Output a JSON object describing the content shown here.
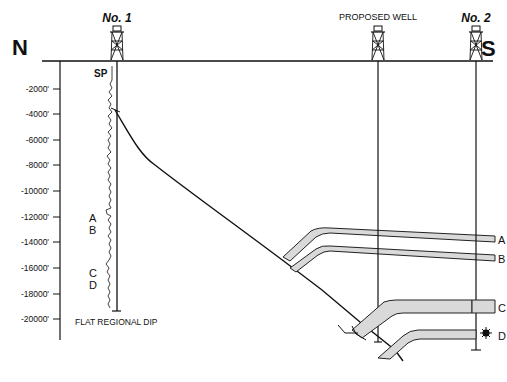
{
  "diagram": {
    "compass": {
      "left": "N",
      "right": "S"
    },
    "wells": [
      {
        "name": "No. 1",
        "x": 117
      },
      {
        "name": "PROPOSED WELL",
        "x": 378
      },
      {
        "name": "No. 2",
        "x": 476
      }
    ],
    "log_label": "SP",
    "depth_axis": {
      "ticks": [
        "-2000'",
        "-4000'",
        "-6000'",
        "-8000'",
        "-10000'",
        "-12000'",
        "-14000'",
        "-16000'",
        "-18000'",
        "-20000'"
      ]
    },
    "log_horizon_labels": [
      "A",
      "B",
      "C",
      "D"
    ],
    "right_horizon_labels": [
      "A",
      "B",
      "C",
      "D"
    ],
    "note": "FLAT REGIONAL DIP",
    "colors": {
      "ink": "#111111",
      "bed_fill": "#d9d9d9",
      "background": "#ffffff"
    }
  }
}
